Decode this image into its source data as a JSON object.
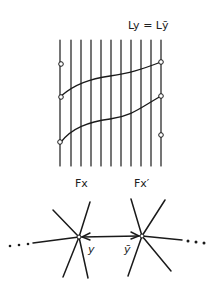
{
  "diagram": {
    "equation_label": "Ly = Lȳ",
    "fiber_labels": {
      "left": "Fx",
      "right": "Fx′"
    },
    "node_labels": {
      "left": "y",
      "right": "ȳ"
    },
    "ellipsis": "• • •",
    "vertical_lines_count": 11,
    "ink_color": "#1a1a1a",
    "background": "#ffffff"
  }
}
